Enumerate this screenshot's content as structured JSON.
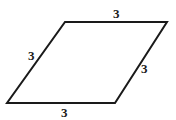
{
  "diagram": {
    "shape": "rhombus",
    "stroke_color": "#1a1a1a",
    "vertices": {
      "top_left": [
        65,
        22
      ],
      "top_right": [
        167,
        22
      ],
      "bottom_right": [
        115,
        103
      ],
      "bottom_left": [
        7,
        103
      ]
    },
    "side_labels": {
      "top": "3",
      "left": "3",
      "right": "3",
      "bottom": "3"
    }
  }
}
